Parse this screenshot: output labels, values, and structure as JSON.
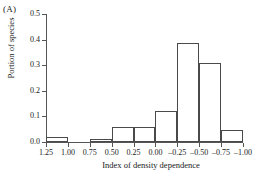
{
  "figure": {
    "panel_label": "(A)",
    "xlabel": "Index of density dependence",
    "ylabel": "Portion of species"
  },
  "chart_data": {
    "type": "bar",
    "title": "(A)",
    "xlabel": "Index of density dependence",
    "ylabel": "Portion of species",
    "ylim": [
      0.0,
      0.5
    ],
    "xlim": [
      1.25,
      -1.0
    ],
    "x_axis_reversed": true,
    "grid": false,
    "legend": null,
    "ytick_labels": [
      "0.0",
      "0.1",
      "0.2",
      "0.3",
      "0.4",
      "0.5"
    ],
    "ytick_values": [
      0.0,
      0.1,
      0.2,
      0.3,
      0.4,
      0.5
    ],
    "xtick_labels": [
      "1.25",
      "1.00",
      "0.75",
      "0.50",
      "0.25",
      "0.00",
      "-0.25",
      "-0.50",
      "-0.75",
      "-1.00"
    ],
    "xtick_values": [
      1.25,
      1.0,
      0.75,
      0.5,
      0.25,
      0.0,
      -0.25,
      -0.5,
      -0.75,
      -1.0
    ],
    "bin_width": 0.25,
    "bins": [
      {
        "left": 1.25,
        "right": 1.0,
        "center": 1.125,
        "value": 0.02
      },
      {
        "left": 1.0,
        "right": 0.75,
        "center": 0.875,
        "value": 0.0
      },
      {
        "left": 0.75,
        "right": 0.5,
        "center": 0.625,
        "value": 0.012
      },
      {
        "left": 0.5,
        "right": 0.25,
        "center": 0.375,
        "value": 0.06
      },
      {
        "left": 0.25,
        "right": 0.0,
        "center": 0.125,
        "value": 0.06
      },
      {
        "left": 0.0,
        "right": -0.25,
        "center": -0.125,
        "value": 0.12
      },
      {
        "left": -0.25,
        "right": -0.5,
        "center": -0.375,
        "value": 0.385
      },
      {
        "left": -0.5,
        "right": -0.75,
        "center": -0.625,
        "value": 0.31
      },
      {
        "left": -0.75,
        "right": -1.0,
        "center": -0.875,
        "value": 0.045
      }
    ],
    "categories": [
      "1.25 to 1.00",
      "1.00 to 0.75",
      "0.75 to 0.50",
      "0.50 to 0.25",
      "0.25 to 0.00",
      "0.00 to -0.25",
      "-0.25 to -0.50",
      "-0.50 to -0.75",
      "-0.75 to -1.00"
    ],
    "values": [
      0.02,
      0.0,
      0.012,
      0.06,
      0.06,
      0.12,
      0.385,
      0.31,
      0.045
    ],
    "colors": {
      "bar_fill": "#ffffff",
      "bar_edge": "#4a4a4a",
      "axis": "#555555",
      "text": "#1a1a1a"
    }
  }
}
